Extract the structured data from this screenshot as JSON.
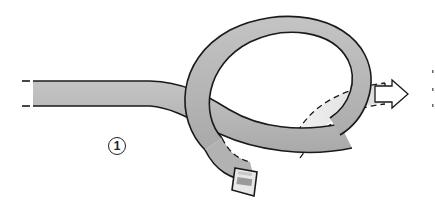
{
  "diagram": {
    "step_number": "1",
    "colors": {
      "rope_fill": "#b8b8b8",
      "rope_light": "#d6d6d6",
      "rope_ghost": "#e9e9e9",
      "outline": "#1a1a1a",
      "background": "#ffffff"
    },
    "elements": [
      "rope-standing-part",
      "rope-loop",
      "rope-working-end",
      "hidden-path-dashed",
      "direction-arrow"
    ]
  }
}
